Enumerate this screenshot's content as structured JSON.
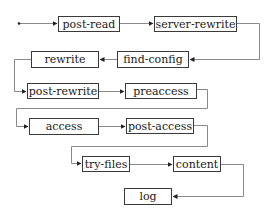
{
  "diagram": {
    "title": "",
    "nodes": [
      {
        "id": "post-read",
        "label": "post-read"
      },
      {
        "id": "server-rewrite",
        "label": "server-rewrite"
      },
      {
        "id": "find-config",
        "label": "find-config"
      },
      {
        "id": "rewrite",
        "label": "rewrite"
      },
      {
        "id": "post-rewrite",
        "label": "post-rewrite"
      },
      {
        "id": "preaccess",
        "label": "preaccess"
      },
      {
        "id": "access",
        "label": "access"
      },
      {
        "id": "post-access",
        "label": "post-access"
      },
      {
        "id": "try-files",
        "label": "try-files"
      },
      {
        "id": "content",
        "label": "content"
      },
      {
        "id": "log",
        "label": "log"
      }
    ],
    "edges": [
      {
        "from": "start",
        "to": "post-read"
      },
      {
        "from": "post-read",
        "to": "server-rewrite"
      },
      {
        "from": "server-rewrite",
        "to": "find-config"
      },
      {
        "from": "find-config",
        "to": "rewrite"
      },
      {
        "from": "rewrite",
        "to": "post-rewrite"
      },
      {
        "from": "post-rewrite",
        "to": "preaccess"
      },
      {
        "from": "preaccess",
        "to": "access"
      },
      {
        "from": "access",
        "to": "post-access"
      },
      {
        "from": "post-access",
        "to": "try-files"
      },
      {
        "from": "try-files",
        "to": "content"
      },
      {
        "from": "content",
        "to": "log"
      }
    ],
    "colors": {
      "line": "#8a8a8a",
      "border": "#3a3a3a",
      "text": "#1a1a1a"
    }
  }
}
